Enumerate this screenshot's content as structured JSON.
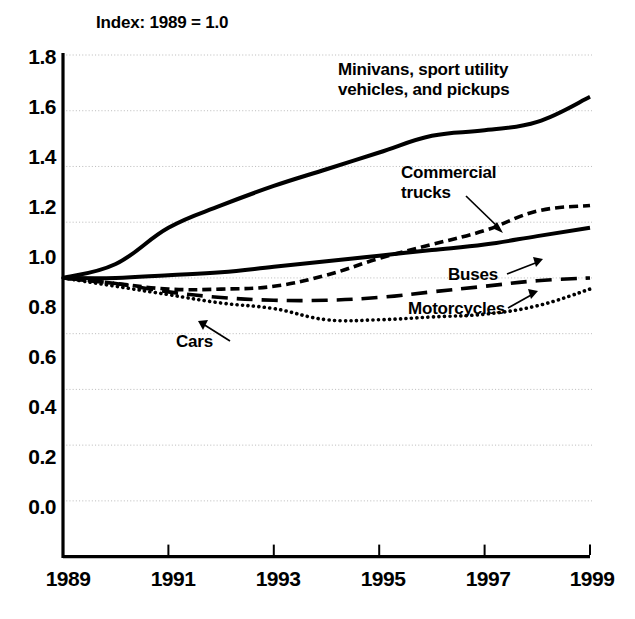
{
  "figure": {
    "subtitle": "Index: 1989 = 1.0",
    "background_color": "#ffffff",
    "line_color": "#000000",
    "grid_color": "#bfbfbf"
  },
  "axes": {
    "y_ticks": [
      "1.8",
      "1.6",
      "1.4",
      "1.2",
      "1.0",
      "0.8",
      "0.6",
      "0.4",
      "0.2",
      "0.0"
    ],
    "x_ticks": [
      "1989",
      "1991",
      "1993",
      "1995",
      "1997",
      "1999"
    ]
  },
  "annotations": {
    "minivans": {
      "line1": "Minivans, sport utility",
      "line2": "vehicles, and pickups"
    },
    "commercial_trucks": {
      "line1": "Commercial",
      "line2": "trucks"
    },
    "buses": {
      "label": "Buses"
    },
    "motorcycles": {
      "label": "Motorcycles"
    },
    "cars": {
      "label": "Cars"
    }
  },
  "chart_data": {
    "type": "line",
    "title": "",
    "subtitle": "Index: 1989 = 1.0",
    "xlabel": "",
    "ylabel": "",
    "xlim": [
      1989,
      1999
    ],
    "ylim": [
      0.0,
      1.8
    ],
    "ytick_step": 0.2,
    "xtick_step": 2,
    "grid": true,
    "grid_axis": "y",
    "legend": "inline-annotations",
    "x": [
      1989,
      1990,
      1991,
      1992,
      1993,
      1994,
      1995,
      1996,
      1997,
      1998,
      1999
    ],
    "series": [
      {
        "name": "Minivans, sport utility vehicles, and pickups",
        "style": "solid",
        "width": "thick",
        "values": [
          1.0,
          1.05,
          1.18,
          1.26,
          1.33,
          1.39,
          1.45,
          1.51,
          1.53,
          1.56,
          1.65
        ]
      },
      {
        "name": "Commercial trucks",
        "style": "short-dash",
        "width": "medium",
        "values": [
          1.0,
          0.98,
          0.96,
          0.96,
          0.97,
          1.01,
          1.07,
          1.12,
          1.17,
          1.24,
          1.26
        ]
      },
      {
        "name": "Buses",
        "style": "solid",
        "width": "thick",
        "values": [
          1.0,
          1.0,
          1.01,
          1.02,
          1.04,
          1.06,
          1.08,
          1.1,
          1.12,
          1.15,
          1.18
        ]
      },
      {
        "name": "Motorcycles",
        "style": "long-dash",
        "width": "medium",
        "values": [
          1.0,
          0.98,
          0.95,
          0.93,
          0.92,
          0.92,
          0.93,
          0.95,
          0.97,
          0.99,
          1.0
        ]
      },
      {
        "name": "Cars",
        "style": "dotted",
        "width": "medium",
        "values": [
          1.0,
          0.97,
          0.94,
          0.91,
          0.89,
          0.85,
          0.85,
          0.86,
          0.87,
          0.9,
          0.96
        ]
      }
    ]
  }
}
